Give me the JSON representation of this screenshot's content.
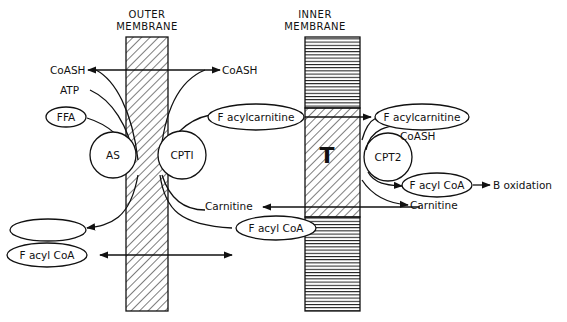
{
  "membranes": {
    "outer": {
      "line1": "OUTER",
      "line2": "MEMBRANE"
    },
    "inner": {
      "line1": "INNER",
      "line2": "MEMBRANE"
    }
  },
  "enzymes": {
    "as": "AS",
    "cpt1": "CPTI",
    "cpt2": "CPT2",
    "translocase": "T"
  },
  "labels": {
    "coash_left": "CoASH",
    "coash_mid": "CoASH",
    "coash_right": "CoASH",
    "atp": "ATP",
    "ffa": "FFA",
    "amp_ppi": "AMP + PP1",
    "facylcoa_left": "F acyl CoA",
    "facylcoa_mid": "F acyl CoA",
    "facylcoa_right": "F acyl CoA",
    "facylcarnitine_mid": "F acylcarnitine",
    "facylcarnitine_right": "F acylcarnitine",
    "carnitine_mid": "Carnitine",
    "carnitine_right": "Carnitine",
    "b_oxidation": "B oxidation"
  }
}
